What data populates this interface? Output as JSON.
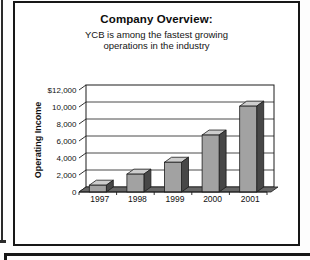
{
  "slide": {
    "title": "Company Overview:",
    "subtitle_line1": "YCB is among the fastest growing",
    "subtitle_line2": "operations in the industry"
  },
  "chart_data": {
    "type": "bar",
    "style": "3d-column-grayscale",
    "title": "",
    "xlabel": "",
    "ylabel": "Operating Income",
    "categories": [
      "1997",
      "1998",
      "1999",
      "2000",
      "2001"
    ],
    "values": [
      800,
      2100,
      3500,
      6700,
      10100
    ],
    "ylim": [
      0,
      12000
    ],
    "ytick_interval": 2000,
    "ytick_labels": [
      "0",
      "2,000",
      "4,000",
      "6,000",
      "8,000",
      "10,000",
      "$12,000"
    ],
    "grid": true,
    "legend": false,
    "colors": {
      "bar_front": "#a2a2a2",
      "bar_top": "#cdcdcd",
      "bar_side": "#474747",
      "floor": "#666666",
      "wall": "#ffffff",
      "line": "#1c1c1c",
      "text": "#111111"
    }
  }
}
